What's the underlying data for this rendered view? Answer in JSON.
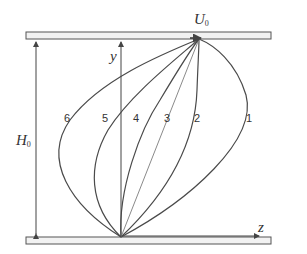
{
  "diagram": {
    "type": "velocity-profile",
    "labels": {
      "top_velocity": {
        "main": "U",
        "sub": "0"
      },
      "gap_height": {
        "main": "H",
        "sub": "0"
      },
      "y_axis": "y",
      "z_axis": "z"
    },
    "curves": [
      {
        "id": "1",
        "label": "1"
      },
      {
        "id": "2",
        "label": "2"
      },
      {
        "id": "3",
        "label": "3"
      },
      {
        "id": "4",
        "label": "4"
      },
      {
        "id": "5",
        "label": "5"
      },
      {
        "id": "6",
        "label": "6"
      }
    ],
    "colors": {
      "line": "#4a4a4a",
      "plate_fill": "#f2f2f2",
      "plate_stroke": "#555555",
      "curve3": "#8a8a8a"
    }
  }
}
